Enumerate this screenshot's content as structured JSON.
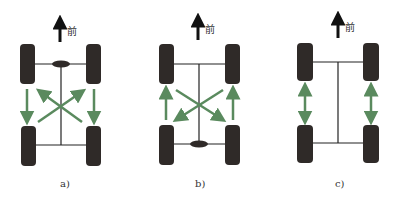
{
  "colors": {
    "wheel": "#2f2a28",
    "axle": "#222222",
    "arrow": "#5a8a5e",
    "forward_arrow": "#111111"
  },
  "front_label": "前",
  "diagrams": [
    {
      "caption": "a)",
      "pattern": "cross-rotation front-drive: fronts move straight back, rears cross to front",
      "differential": "front"
    },
    {
      "caption": "b)",
      "pattern": "rearward cross: rears move straight forward, fronts cross to rear",
      "differential": "rear"
    },
    {
      "caption": "c)",
      "pattern": "front-to-rear same side swap",
      "differential": "none"
    }
  ]
}
